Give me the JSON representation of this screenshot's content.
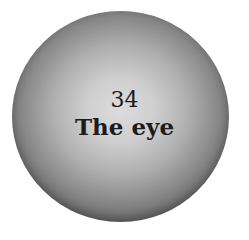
{
  "badge": {
    "number": "34",
    "title": "The eye",
    "colors": {
      "center": "#dcdcdc",
      "edge": "#5a5a5a",
      "text": "#1c1c1c",
      "background": "#ffffff"
    }
  }
}
